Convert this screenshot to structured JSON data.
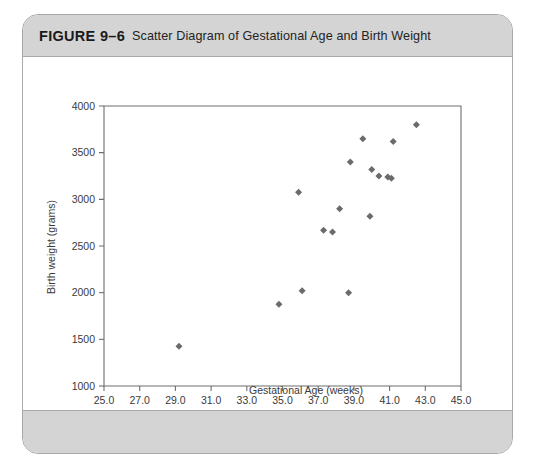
{
  "figure": {
    "number": "FIGURE 9–6",
    "title": "Scatter Diagram of Gestational Age and Birth Weight"
  },
  "chart_data": {
    "type": "scatter",
    "title": "Scatter Diagram of Gestational Age and Birth Weight",
    "xlabel": "Gestational Age (weeks)",
    "ylabel": "Birth weight (grams)",
    "xlim": [
      25.0,
      45.0
    ],
    "ylim": [
      1000,
      4000
    ],
    "xticks": [
      "25.0",
      "27.0",
      "29.0",
      "31.0",
      "33.0",
      "35.0",
      "37.0",
      "39.0",
      "41.0",
      "43.0",
      "45.0"
    ],
    "xtick_values": [
      25.0,
      27.0,
      29.0,
      31.0,
      33.0,
      35.0,
      37.0,
      39.0,
      41.0,
      43.0,
      45.0
    ],
    "yticks": [
      "1000",
      "1500",
      "2000",
      "2500",
      "3000",
      "3500",
      "4000"
    ],
    "ytick_values": [
      1000,
      1500,
      2000,
      2500,
      3000,
      3500,
      4000
    ],
    "grid": false,
    "legend": false,
    "marker": "diamond",
    "marker_color": "#6b6b6b",
    "series": [
      {
        "name": "Infants",
        "x": [
          29.2,
          34.8,
          36.1,
          35.9,
          38.7,
          37.3,
          37.8,
          38.2,
          39.5,
          40.0,
          39.3,
          40.4,
          40.8,
          41.0,
          41.1,
          39.9,
          41.0,
          42.5,
          38.9
        ],
        "y": [
          1425,
          1875,
          2020,
          3075,
          2000,
          2670,
          2650,
          2900,
          3400,
          3320,
          3650,
          3250,
          3230,
          3250,
          3230,
          2820,
          3620,
          3800,
          3400
        ]
      }
    ],
    "points": [
      {
        "x": 29.2,
        "y": 1425
      },
      {
        "x": 34.8,
        "y": 1875
      },
      {
        "x": 36.1,
        "y": 2020
      },
      {
        "x": 35.9,
        "y": 3075
      },
      {
        "x": 38.7,
        "y": 2000
      },
      {
        "x": 37.3,
        "y": 2670
      },
      {
        "x": 37.8,
        "y": 2650
      },
      {
        "x": 38.2,
        "y": 2900
      },
      {
        "x": 38.8,
        "y": 3400
      },
      {
        "x": 40.0,
        "y": 3320
      },
      {
        "x": 39.5,
        "y": 3650
      },
      {
        "x": 40.4,
        "y": 3250
      },
      {
        "x": 40.9,
        "y": 3240
      },
      {
        "x": 41.1,
        "y": 3225
      },
      {
        "x": 39.9,
        "y": 2820
      },
      {
        "x": 41.2,
        "y": 3620
      },
      {
        "x": 42.5,
        "y": 3800
      }
    ]
  },
  "colors": {
    "card_border": "#a9a9a9",
    "band": "#d4d4d4",
    "axis": "#6e6e6e",
    "marker": "#6b6b6b",
    "text": "#3a3a3a"
  }
}
